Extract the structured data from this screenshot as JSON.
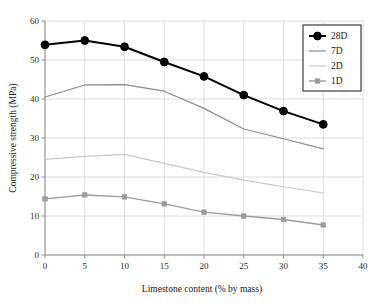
{
  "chart_data": {
    "type": "line",
    "title": "",
    "xlabel": "Limestone content (% by mass)",
    "ylabel": "Compressive strength (MPa)",
    "x": [
      0,
      5,
      10,
      15,
      20,
      25,
      30,
      35
    ],
    "xlim": [
      0,
      40
    ],
    "ylim": [
      0,
      60
    ],
    "xticks": [
      "0",
      "5",
      "10",
      "15",
      "20",
      "25",
      "30",
      "35",
      "40"
    ],
    "xtick_values": [
      0,
      5,
      10,
      15,
      20,
      25,
      30,
      35,
      40
    ],
    "yticks": [
      "0",
      "10",
      "20",
      "30",
      "40",
      "50",
      "60"
    ],
    "ytick_values": [
      0,
      10,
      20,
      30,
      40,
      50,
      60
    ],
    "grid": true,
    "legend_position": "top-right",
    "series": [
      {
        "name": "28D",
        "values": [
          53.9,
          55.0,
          53.4,
          49.5,
          45.8,
          41.0,
          36.9,
          33.5
        ],
        "color": "#000000",
        "marker": "diamond",
        "line_width": 2.0,
        "marker_size": 5.0
      },
      {
        "name": "7D",
        "values": [
          40.5,
          43.6,
          43.7,
          42.0,
          37.6,
          32.3,
          29.8,
          27.2
        ],
        "color": "#8a8a8a",
        "marker": "none",
        "line_width": 1.2,
        "marker_size": 0
      },
      {
        "name": "2D",
        "values": [
          24.5,
          25.3,
          25.8,
          23.5,
          21.2,
          19.2,
          17.5,
          15.9
        ],
        "color": "#c9c9c9",
        "marker": "none",
        "line_width": 1.2,
        "marker_size": 0
      },
      {
        "name": "1D",
        "values": [
          14.4,
          15.4,
          14.9,
          13.1,
          11.0,
          10.0,
          9.1,
          7.7
        ],
        "color": "#9c9c9c",
        "marker": "square",
        "line_width": 1.4,
        "marker_size": 4.4
      }
    ]
  },
  "legend": {
    "entries": [
      {
        "label": "28D",
        "color": "#000000",
        "marker": "diamond"
      },
      {
        "label": "7D",
        "color": "#8a8a8a",
        "marker": "none"
      },
      {
        "label": "2D",
        "color": "#c9c9c9",
        "marker": "none"
      },
      {
        "label": "1D",
        "color": "#9c9c9c",
        "marker": "square"
      }
    ],
    "border_color": "#3d3d3d"
  },
  "style": {
    "grid_color": "#d6d6d6",
    "axis_color": "#8f8f8f",
    "background": "#ffffff"
  }
}
